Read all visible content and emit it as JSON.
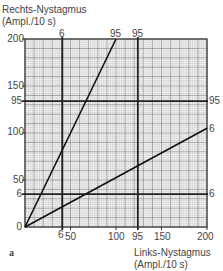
{
  "chart_data": {
    "type": "line",
    "title": "",
    "panel_label": "a",
    "xlabel": "Links-Nystagmus (Ampl./10 s)",
    "ylabel": "Rechts-Nystagmus (Ampl./10 s)",
    "xlabel_lines": [
      "Links-Nystagmus",
      "(Ampl./10 s)"
    ],
    "ylabel_lines": [
      "Rechts-Nystagmus",
      "(Ampl./10 s)"
    ],
    "xlim": [
      0,
      200
    ],
    "ylim": [
      0,
      200
    ],
    "x_ticks": [
      50,
      100,
      150,
      200
    ],
    "y_ticks": [
      50,
      100,
      150,
      200
    ],
    "origin_label": "0",
    "grid": true,
    "series": [
      {
        "name": "95",
        "x": [
          0,
          100
        ],
        "y": [
          0,
          200
        ]
      },
      {
        "name": "6",
        "x": [
          0,
          200
        ],
        "y": [
          0,
          105
        ]
      }
    ],
    "reference_lines": [
      {
        "orientation": "vertical",
        "label": "6",
        "value": 41
      },
      {
        "orientation": "vertical",
        "label": "95",
        "value": 124
      },
      {
        "orientation": "horizontal",
        "label": "95",
        "value": 134
      },
      {
        "orientation": "horizontal",
        "label": "6",
        "value": 35
      }
    ]
  }
}
